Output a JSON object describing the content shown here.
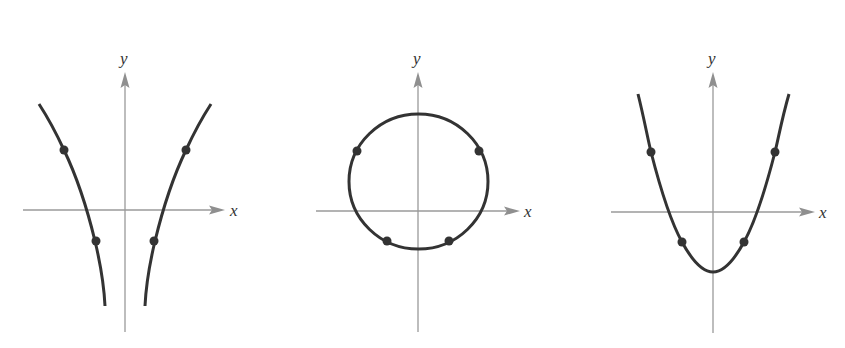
{
  "figure": {
    "colors": {
      "axis": "#9a9a9a",
      "curve": "#333333",
      "point": "#333333",
      "background": "#ffffff"
    },
    "panels": [
      {
        "id": "panel-1",
        "shape": "two-branch curve (hyperbola-like, opening upward and downward)",
        "x_label": "x",
        "y_label": "y",
        "marked_points": 4
      },
      {
        "id": "panel-2",
        "shape": "circle",
        "x_label": "x",
        "y_label": "y",
        "marked_points": 4
      },
      {
        "id": "panel-3",
        "shape": "parabola opening upward",
        "x_label": "x",
        "y_label": "y",
        "marked_points": 4
      }
    ]
  }
}
